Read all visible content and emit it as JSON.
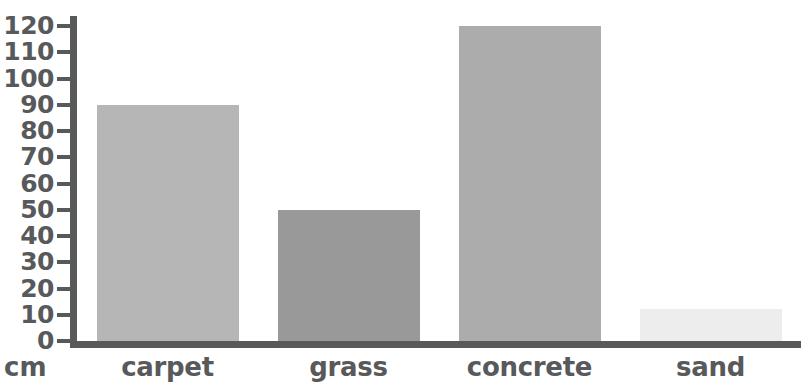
{
  "chart_data": {
    "type": "bar",
    "title": "",
    "subtitle": "",
    "xlabel": "",
    "ylabel": "cm",
    "categories": [
      "carpet",
      "grass",
      "concrete",
      "sand"
    ],
    "values": [
      90,
      50,
      120,
      12
    ],
    "series": [
      {
        "name": "bounce height",
        "values": [
          90,
          50,
          120,
          12
        ]
      }
    ],
    "ylim": [
      0,
      120
    ],
    "y_tick_step": 10,
    "y_ticks": [
      0,
      10,
      20,
      30,
      40,
      50,
      60,
      70,
      80,
      90,
      100,
      110,
      120
    ],
    "y_tick_labels": [
      "0",
      "10",
      "20",
      "30",
      "40",
      "50",
      "60",
      "70",
      "80",
      "90",
      "100",
      "110",
      "120"
    ],
    "grid": false,
    "legend": false,
    "legend_position": "none",
    "bar_colors": [
      "#b6b6b6",
      "#999999",
      "#acacac",
      "#ededed"
    ],
    "axis_color": "#58595b",
    "text_color": "#58595b",
    "background_color": "#ffffff",
    "annotations": []
  },
  "axis": {
    "unit_label": "cm"
  }
}
